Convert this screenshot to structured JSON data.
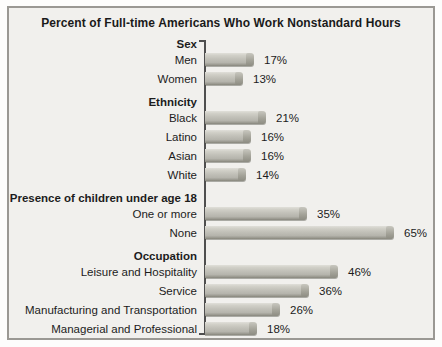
{
  "chart_data": {
    "type": "bar",
    "orientation": "horizontal",
    "title": "Percent of Full-time Americans Who Work Nonstandard Hours",
    "unit": "%",
    "xlim": [
      0,
      70
    ],
    "grid": false,
    "legend": "none",
    "groups": [
      {
        "label": "Sex",
        "items": [
          {
            "label": "Men",
            "value": 17,
            "display": "17%"
          },
          {
            "label": "Women",
            "value": 13,
            "display": "13%"
          }
        ]
      },
      {
        "label": "Ethnicity",
        "items": [
          {
            "label": "Black",
            "value": 21,
            "display": "21%"
          },
          {
            "label": "Latino",
            "value": 16,
            "display": "16%"
          },
          {
            "label": "Asian",
            "value": 16,
            "display": "16%"
          },
          {
            "label": "White",
            "value": 14,
            "display": "14%"
          }
        ]
      },
      {
        "label": "Presence of children under age 18",
        "items": [
          {
            "label": "One or more",
            "value": 35,
            "display": "35%"
          },
          {
            "label": "None",
            "value": 65,
            "display": "65%"
          }
        ]
      },
      {
        "label": "Occupation",
        "items": [
          {
            "label": "Leisure and Hospitality",
            "value": 46,
            "display": "46%"
          },
          {
            "label": "Service",
            "value": 36,
            "display": "36%"
          },
          {
            "label": "Manufacturing and Transportation",
            "value": 26,
            "display": "26%"
          },
          {
            "label": "Managerial and Professional",
            "value": 18,
            "display": "18%"
          }
        ]
      }
    ]
  },
  "colors": {
    "page_bg": "#fdfdfc",
    "panel_bg": "#f1f0ed",
    "panel_border": "#9a9893",
    "title_text": "#1a1a1a",
    "label_text": "#1c1c1c",
    "axis_line": "#4f4f4f",
    "bar_body": "#c2c1b9",
    "bar_highlight": "#e0dfd9",
    "bar_shadow": "#87867c",
    "bar_cap": "#a5a49a"
  }
}
